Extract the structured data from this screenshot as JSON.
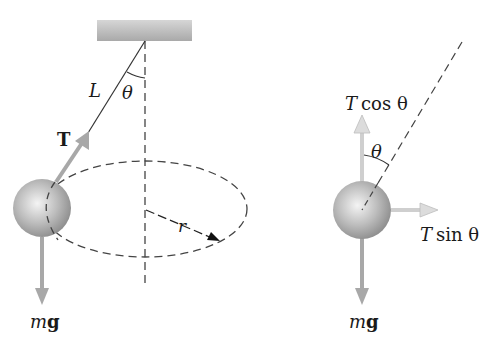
{
  "left_figure": {
    "labels": {
      "length": "L",
      "angle": "θ",
      "tension": "T",
      "radius": "r",
      "weight_m": "m",
      "weight_g": "g"
    }
  },
  "right_figure": {
    "labels": {
      "vertical_T": "T",
      "vertical_func": "cos θ",
      "angle": "θ",
      "horizontal_T": "T",
      "horizontal_func": "sin θ",
      "weight_m": "m",
      "weight_g": "g"
    }
  },
  "colors": {
    "string": "#333333",
    "dashed": "#333333",
    "force_arrow": "#a8a8a8",
    "component_arrow": "#d8d8d8",
    "ceiling": "#bdbdbd",
    "ball_light": "#f2f2f2",
    "ball_dark": "#8a8a8a"
  }
}
